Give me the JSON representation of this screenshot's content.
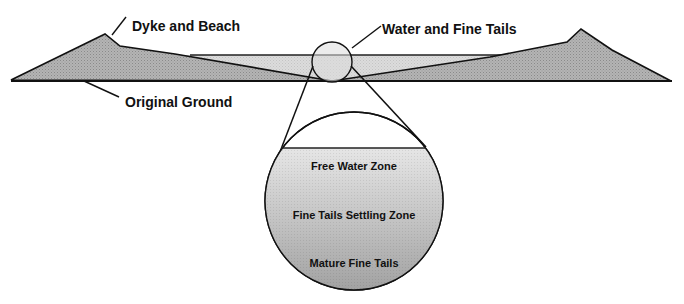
{
  "labels": {
    "dyke": "Dyke and Beach",
    "water": "Water and Fine Tails",
    "ground": "Original Ground"
  },
  "zones": {
    "free_water": "Free Water Zone",
    "settling": "Fine Tails Settling Zone",
    "mature": "Mature Fine Tails"
  },
  "colors": {
    "dyke_fill": "#a8a8a8",
    "water_fill": "#d4d4d4",
    "line": "#111111"
  }
}
